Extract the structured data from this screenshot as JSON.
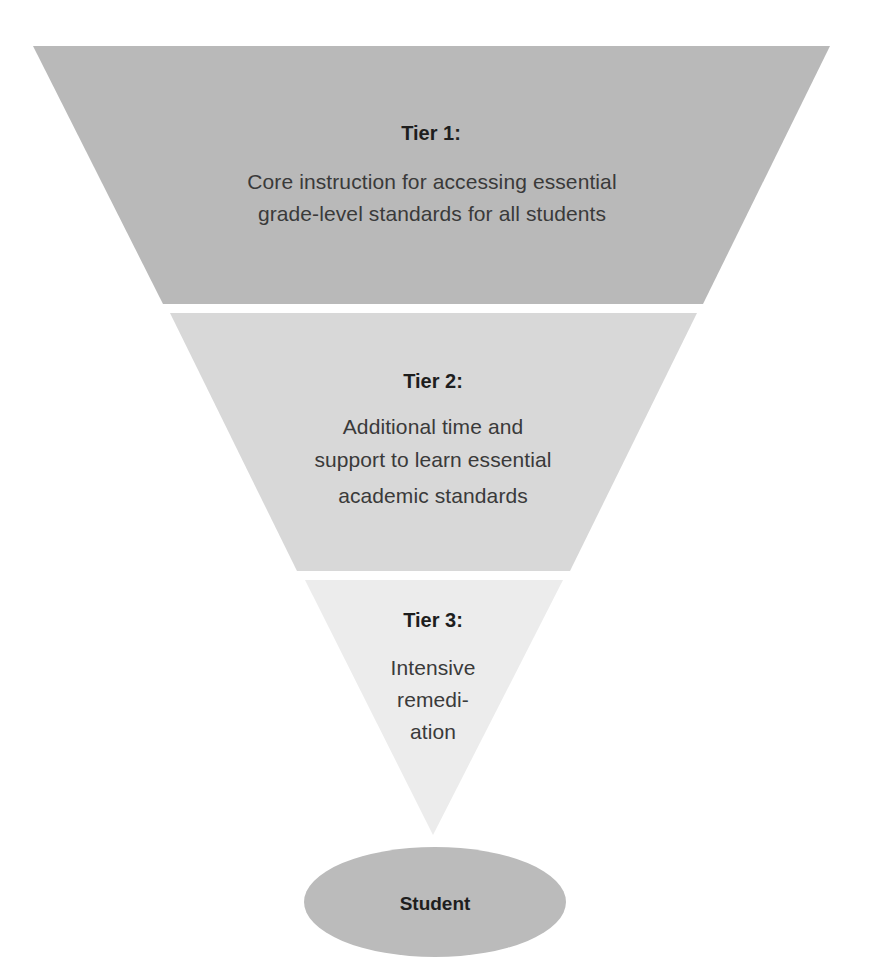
{
  "diagram": {
    "type": "inverted-pyramid",
    "tiers": [
      {
        "title": "Tier 1:",
        "lines": [
          "Core instruction for accessing essential",
          "grade-level standards for all students"
        ],
        "color": "#b9b9b9"
      },
      {
        "title": "Tier 2:",
        "lines": [
          "Additional time and",
          "support to learn essential",
          "academic standards"
        ],
        "color": "#d8d8d8"
      },
      {
        "title": "Tier 3:",
        "lines": [
          "Intensive",
          "remedi-",
          "ation"
        ],
        "color": "#ececec"
      }
    ],
    "base": {
      "label": "Student",
      "color": "#bbbbbb"
    }
  }
}
